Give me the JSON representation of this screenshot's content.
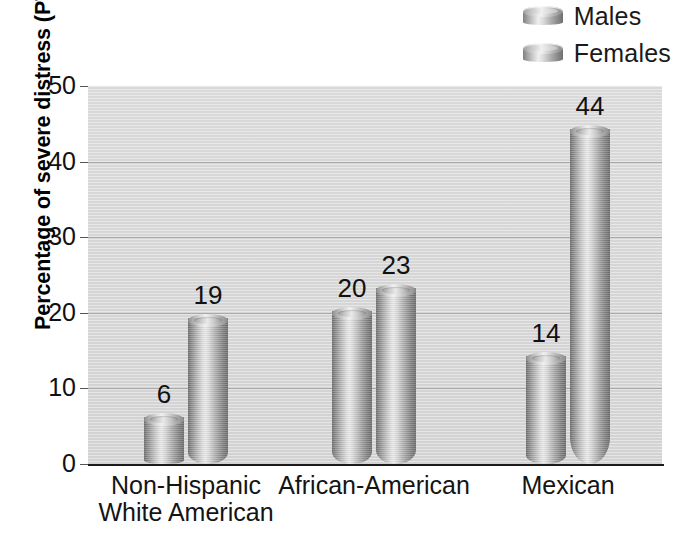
{
  "chart_data": {
    "type": "bar",
    "title": "",
    "subtitle": "",
    "xlabel": "",
    "ylabel": "Percentage of severe distress (PTSD)",
    "categories": [
      "Non-Hispanic\nWhite American",
      "African-American",
      "Mexican"
    ],
    "series": [
      {
        "name": "Males",
        "values": [
          6,
          20,
          14
        ]
      },
      {
        "name": "Females",
        "values": [
          19,
          23,
          44
        ]
      }
    ],
    "ylim": [
      0,
      50
    ],
    "ytick_labels": [
      "0",
      "10",
      "20",
      "30",
      "40",
      "50"
    ],
    "ytick_values": [
      0,
      10,
      20,
      30,
      40,
      50
    ],
    "gridlines": [
      10,
      20,
      30,
      40
    ],
    "grid": true,
    "legend_position": "top-right",
    "data_labels": [
      "6",
      "19",
      "20",
      "23",
      "14",
      "44"
    ],
    "bar_style": "3d-cylinder"
  },
  "legend": {
    "items": [
      {
        "label": "Males"
      },
      {
        "label": "Females"
      }
    ]
  },
  "colors": {
    "plot_background": "#d5d5d5",
    "gridline": "#a9a9a9",
    "axis": "#1b1b1b",
    "bar_light": "#ebebeb",
    "bar_dark": "#6d6d6d",
    "text": "#111111",
    "page_background": "#ffffff"
  }
}
